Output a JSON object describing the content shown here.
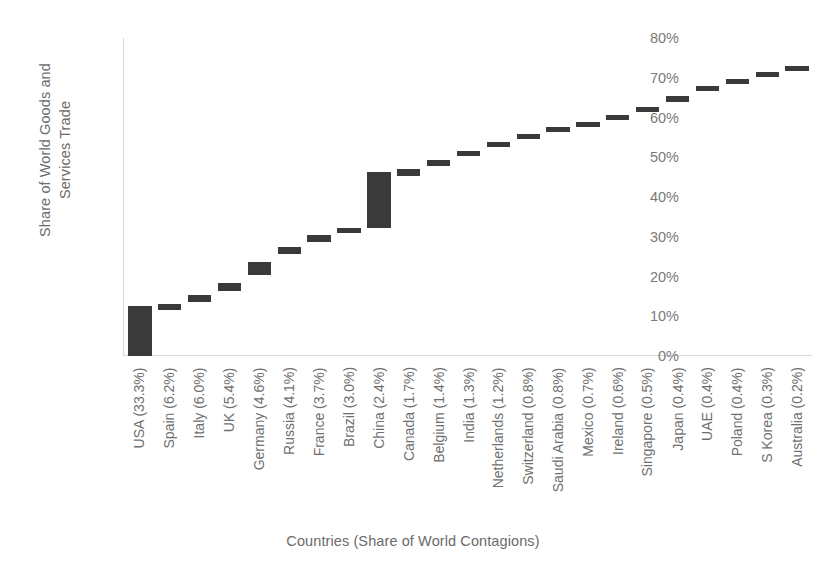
{
  "chart_data": {
    "type": "bar",
    "chart_style": "waterfall",
    "title": "",
    "xlabel": "Countries (Share of World Contagions)",
    "ylabel": "Share of World Goods and Services Trade",
    "ylabel_lines": [
      "Share of World Goods and",
      "Services Trade"
    ],
    "ylim": [
      0,
      0.8
    ],
    "ytick_labels": [
      "80%",
      "70%",
      "60%",
      "50%",
      "40%",
      "30%",
      "20%",
      "10%",
      "0%"
    ],
    "ytick_values": [
      80,
      70,
      60,
      50,
      40,
      30,
      20,
      10,
      0
    ],
    "grid": false,
    "legend": false,
    "bar_color": "#3a3a3a",
    "axis_color": "#d9d9d9",
    "text_color": "#6f6f6f",
    "categories": [
      "USA (33.3%)",
      "Spain (6.2%)",
      "Italy (6.0%)",
      "UK (5.4%)",
      "Germany (4.6%)",
      "Russia (4.1%)",
      "France (3.7%)",
      "Brazil (3.0%)",
      "China (2.4%)",
      "Canada (1.7%)",
      "Belgium (1.4%)",
      "India (1.3%)",
      "Netherlands (1.2%)",
      "Switzerland (0.8%)",
      "Saudi Arabia (0.8%)",
      "Mexico (0.7%)",
      "Ireland (0.6%)",
      "Singapore (0.5%)",
      "Japan (0.4%)",
      "UAE (0.4%)",
      "Poland (0.4%)",
      "S Korea (0.3%)",
      "Australia (0.2%)"
    ],
    "country_names": [
      "USA",
      "Spain",
      "Italy",
      "UK",
      "Germany",
      "Russia",
      "France",
      "Brazil",
      "China",
      "Canada",
      "Belgium",
      "India",
      "Netherlands",
      "Switzerland",
      "Saudi Arabia",
      "Mexico",
      "Ireland",
      "Singapore",
      "Japan",
      "UAE",
      "Poland",
      "S Korea",
      "Australia"
    ],
    "contagion_share_pct": [
      33.3,
      6.2,
      6.0,
      5.4,
      4.6,
      4.1,
      3.7,
      3.0,
      2.4,
      1.7,
      1.4,
      1.3,
      1.2,
      0.8,
      0.8,
      0.7,
      0.6,
      0.5,
      0.4,
      0.4,
      0.4,
      0.3,
      0.2
    ],
    "values": [
      12.0,
      1.5,
      1.7,
      2.0,
      3.0,
      1.5,
      2.2,
      1.1,
      13.3,
      3.3,
      1.0,
      1.2,
      1.2,
      1.3,
      0.7,
      0.8,
      0.8,
      0.9,
      2.2,
      1.3,
      1.0,
      1.3,
      0.7
    ],
    "cumulative_start_pct": [
      0.0,
      12.0,
      13.5,
      15.2,
      17.2,
      20.2,
      21.7,
      23.9,
      32.2,
      45.5,
      48.8,
      49.8,
      51.0,
      52.2,
      53.5,
      54.2,
      55.0,
      55.8,
      56.7,
      58.9,
      60.2,
      61.2,
      62.5
    ],
    "cumulative_end_pct": [
      12.0,
      13.5,
      15.2,
      17.2,
      20.2,
      21.7,
      23.9,
      32.2,
      45.5,
      48.8,
      49.8,
      51.0,
      52.2,
      53.5,
      54.2,
      55.0,
      55.8,
      56.7,
      58.9,
      60.2,
      61.2,
      62.5,
      63.2
    ],
    "bars": [
      {
        "label": "USA (33.3%)",
        "bottom_pct": 0.0,
        "top_pct": 12.6
      },
      {
        "label": "Spain (6.2%)",
        "bottom_pct": 11.6,
        "top_pct": 13.1
      },
      {
        "label": "Italy (6.0%)",
        "bottom_pct": 13.6,
        "top_pct": 15.3
      },
      {
        "label": "UK (5.4%)",
        "bottom_pct": 16.4,
        "top_pct": 18.4
      },
      {
        "label": "Germany (4.6%)",
        "bottom_pct": 20.4,
        "top_pct": 23.7
      },
      {
        "label": "Russia (4.1%)",
        "bottom_pct": 25.7,
        "top_pct": 27.4
      },
      {
        "label": "France (3.7%)",
        "bottom_pct": 28.6,
        "top_pct": 30.5
      },
      {
        "label": "Brazil (3.0%)",
        "bottom_pct": 30.9,
        "top_pct": 32.2
      },
      {
        "label": "China (2.4%)",
        "bottom_pct": 32.2,
        "top_pct": 46.3
      },
      {
        "label": "Canada (1.7%)",
        "bottom_pct": 45.2,
        "top_pct": 47.1
      },
      {
        "label": "Belgium (1.4%)",
        "bottom_pct": 47.9,
        "top_pct": 49.2
      },
      {
        "label": "India (1.3%)",
        "bottom_pct": 50.2,
        "top_pct": 51.4
      },
      {
        "label": "Netherlands (1.2%)",
        "bottom_pct": 52.5,
        "top_pct": 53.7
      },
      {
        "label": "Switzerland (0.8%)",
        "bottom_pct": 54.7,
        "top_pct": 55.8
      },
      {
        "label": "Saudi Arabia (0.8%)",
        "bottom_pct": 56.3,
        "top_pct": 57.3
      },
      {
        "label": "Mexico (0.7%)",
        "bottom_pct": 57.6,
        "top_pct": 58.6
      },
      {
        "label": "Ireland (0.6%)",
        "bottom_pct": 59.5,
        "top_pct": 60.5
      },
      {
        "label": "Singapore (0.5%)",
        "bottom_pct": 61.3,
        "top_pct": 62.3
      },
      {
        "label": "Japan (0.4%)",
        "bottom_pct": 63.8,
        "top_pct": 65.3
      },
      {
        "label": "UAE (0.4%)",
        "bottom_pct": 66.6,
        "top_pct": 67.7
      },
      {
        "label": "Poland (0.4%)",
        "bottom_pct": 68.5,
        "top_pct": 69.5
      },
      {
        "label": "S Korea (0.3%)",
        "bottom_pct": 70.2,
        "top_pct": 71.2
      },
      {
        "label": "Australia (0.2%)",
        "bottom_pct": 71.7,
        "top_pct": 72.6
      }
    ]
  }
}
